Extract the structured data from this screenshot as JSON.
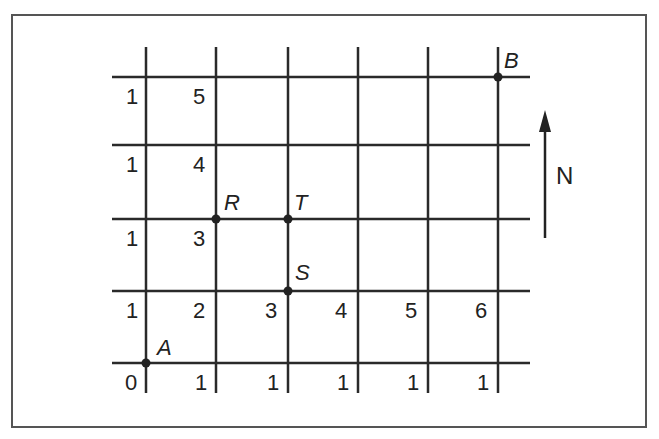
{
  "diagram": {
    "type": "street-grid-path-count",
    "compass": {
      "label": "N",
      "direction": "up"
    },
    "points": {
      "A": "A",
      "B": "B",
      "R": "R",
      "S": "S",
      "T": "T"
    },
    "column_labels_bottom_row": [
      "0",
      "1",
      "1",
      "1",
      "1",
      "1"
    ],
    "row_labels_left_column": [
      "1",
      "1",
      "1",
      "1"
    ],
    "second_column_labels": [
      "5",
      "4",
      "3",
      "2"
    ],
    "second_row_labels": [
      "2",
      "3",
      "4",
      "5",
      "6"
    ]
  }
}
